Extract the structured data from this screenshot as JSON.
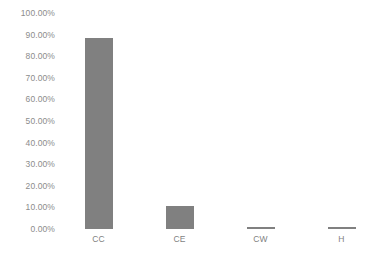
{
  "chart_data": {
    "type": "bar",
    "title": "",
    "xlabel": "",
    "ylabel": "",
    "categories": [
      "CC",
      "CE",
      "CW",
      "H"
    ],
    "values": [
      88.5,
      10.5,
      0.5,
      0.5
    ],
    "value_labels": [
      "88.50%",
      "10.50%",
      "0.50%",
      "0.50%"
    ],
    "ylim": [
      0,
      100
    ],
    "ytick_values": [
      0,
      10,
      20,
      30,
      40,
      50,
      60,
      70,
      80,
      90,
      100
    ],
    "ytick_labels": [
      "0.00%",
      "10.00%",
      "20.00%",
      "30.00%",
      "40.00%",
      "50.00%",
      "60.00%",
      "70.00%",
      "80.00%",
      "90.00%",
      "100.00%"
    ],
    "grid": false,
    "legend": false,
    "legend_position": "none",
    "series": [
      {
        "name": "Series 1",
        "values": [
          88.5,
          10.5,
          0.5,
          0.5
        ]
      }
    ],
    "colors": {
      "bar_fill": "#808080",
      "tick_label": "#8c8c8c",
      "category_label": "#7f7f7f",
      "background": "#ffffff"
    }
  }
}
